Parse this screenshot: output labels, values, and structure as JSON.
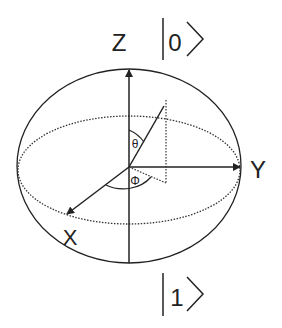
{
  "diagram": {
    "type": "bloch-sphere",
    "axes": {
      "z": {
        "label": "Z",
        "state": "0"
      },
      "y": {
        "label": "Y"
      },
      "x": {
        "label": "X"
      },
      "bottom_state": "1"
    },
    "angles": {
      "theta": "θ",
      "phi": "Φ"
    },
    "colors": {
      "stroke": "#222222",
      "background": "#ffffff"
    }
  }
}
